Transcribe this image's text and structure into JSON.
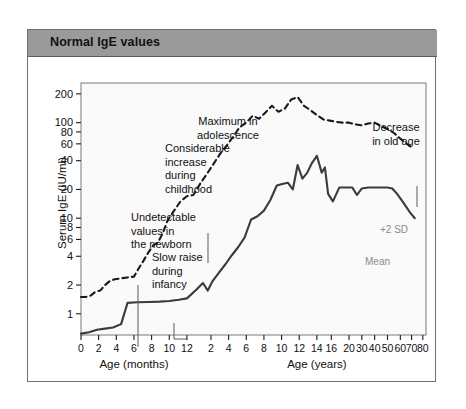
{
  "figure": {
    "title": "Normal IgE values",
    "title_bg": "#9a9a9a",
    "frame_color": "#6e6e6e",
    "plot_bg": "#fafafa"
  },
  "chart_data": {
    "type": "line",
    "title": "Normal IgE values",
    "xlabel_left": "Age (months)",
    "xlabel_right": "Age (years)",
    "ylabel": "Serum IgE (IU/ml)",
    "yscale": "log",
    "ylim": [
      0.6,
      260
    ],
    "yticks": [
      1,
      2,
      4,
      6,
      8,
      10,
      20,
      40,
      60,
      80,
      100,
      200
    ],
    "ytick_labels": [
      "1",
      "2",
      "4",
      "6",
      "8",
      "10",
      "20",
      "40",
      "60",
      "80",
      "100",
      "200"
    ],
    "x_months_ticks": [
      0,
      2,
      4,
      6,
      8,
      10,
      12
    ],
    "x_months_labels": [
      "0",
      "2",
      "4",
      "6",
      "8",
      "10",
      "12"
    ],
    "x_years_ticks": [
      2,
      4,
      6,
      8,
      10,
      12,
      14,
      16,
      20,
      30,
      40,
      50,
      60,
      70,
      80
    ],
    "x_years_labels": [
      "2",
      "4",
      "6",
      "8",
      "10",
      "12",
      "14",
      "16",
      "20",
      "30",
      "40",
      "50",
      "60",
      "70",
      "80"
    ],
    "grid": false,
    "legend": "inline-annotations",
    "series": [
      {
        "name": "+2 SD",
        "style": "dashed",
        "color": "#1a1a1a",
        "label_text": "+2 SD",
        "label_color": "#8b8b8b",
        "points": [
          [
            0.0,
            1.5
          ],
          [
            0.06,
            1.5
          ],
          [
            0.12,
            1.55
          ],
          [
            0.18,
            1.7
          ],
          [
            0.24,
            1.75
          ],
          [
            0.3,
            2.0
          ],
          [
            0.36,
            2.2
          ],
          [
            0.42,
            2.3
          ],
          [
            0.5,
            2.35
          ],
          [
            0.58,
            2.4
          ],
          [
            0.66,
            2.45
          ],
          [
            0.72,
            3.0
          ],
          [
            0.78,
            3.6
          ],
          [
            0.84,
            4.4
          ],
          [
            0.9,
            5.2
          ],
          [
            0.96,
            5.6
          ],
          [
            1.02,
            7.0
          ],
          [
            1.08,
            9.5
          ],
          [
            1.16,
            12.0
          ],
          [
            1.24,
            15.0
          ],
          [
            1.32,
            17.0
          ],
          [
            1.4,
            17.5
          ],
          [
            1.5,
            24.0
          ],
          [
            1.58,
            30.0
          ],
          [
            1.66,
            38.0
          ],
          [
            1.74,
            48.0
          ],
          [
            1.82,
            58.0
          ],
          [
            1.9,
            72.0
          ],
          [
            1.98,
            90.0
          ],
          [
            2.06,
            100.0
          ],
          [
            2.14,
            118.0
          ],
          [
            2.22,
            110.0
          ],
          [
            2.3,
            128.0
          ],
          [
            2.38,
            150.0
          ],
          [
            2.46,
            130.0
          ],
          [
            2.54,
            140.0
          ],
          [
            2.62,
            175.0
          ],
          [
            2.7,
            185.0
          ],
          [
            2.78,
            150.0
          ],
          [
            2.86,
            135.0
          ],
          [
            2.94,
            120.0
          ],
          [
            3.02,
            108.0
          ],
          [
            3.1,
            105.0
          ],
          [
            3.18,
            102.0
          ],
          [
            3.26,
            100.0
          ],
          [
            3.34,
            100.0
          ],
          [
            3.42,
            96.0
          ],
          [
            3.5,
            94.0
          ],
          [
            3.58,
            98.0
          ],
          [
            3.66,
            100.0
          ],
          [
            3.74,
            92.0
          ],
          [
            3.82,
            86.0
          ],
          [
            3.9,
            78.0
          ],
          [
            3.98,
            68.0
          ],
          [
            4.06,
            60.0
          ],
          [
            4.14,
            54.0
          ]
        ]
      },
      {
        "name": "Mean",
        "style": "solid",
        "color": "#3b3b3b",
        "label_text": "Mean",
        "label_color": "#8b8b8b",
        "points": [
          [
            0.0,
            0.62
          ],
          [
            0.1,
            0.64
          ],
          [
            0.2,
            0.68
          ],
          [
            0.3,
            0.7
          ],
          [
            0.4,
            0.72
          ],
          [
            0.5,
            0.78
          ],
          [
            0.58,
            1.3
          ],
          [
            0.7,
            1.32
          ],
          [
            0.84,
            1.33
          ],
          [
            0.98,
            1.34
          ],
          [
            1.1,
            1.36
          ],
          [
            1.22,
            1.4
          ],
          [
            1.32,
            1.45
          ],
          [
            1.44,
            1.8
          ],
          [
            1.52,
            2.1
          ],
          [
            1.58,
            1.75
          ],
          [
            1.64,
            2.2
          ],
          [
            1.72,
            2.7
          ],
          [
            1.8,
            3.3
          ],
          [
            1.88,
            4.1
          ],
          [
            1.96,
            5.0
          ],
          [
            2.04,
            6.3
          ],
          [
            2.12,
            9.7
          ],
          [
            2.2,
            10.5
          ],
          [
            2.28,
            12.0
          ],
          [
            2.36,
            15.5
          ],
          [
            2.44,
            22.0
          ],
          [
            2.52,
            23.0
          ],
          [
            2.58,
            23.5
          ],
          [
            2.64,
            20.0
          ],
          [
            2.7,
            36.0
          ],
          [
            2.76,
            26.0
          ],
          [
            2.82,
            30.0
          ],
          [
            2.88,
            38.0
          ],
          [
            2.94,
            45.0
          ],
          [
            3.0,
            30.0
          ],
          [
            3.04,
            34.0
          ],
          [
            3.08,
            18.0
          ],
          [
            3.14,
            15.0
          ],
          [
            3.22,
            21.0
          ],
          [
            3.3,
            21.0
          ],
          [
            3.38,
            21.0
          ],
          [
            3.44,
            17.5
          ],
          [
            3.5,
            20.5
          ],
          [
            3.58,
            21.0
          ],
          [
            3.66,
            21.0
          ],
          [
            3.74,
            21.0
          ],
          [
            3.82,
            21.0
          ],
          [
            3.88,
            20.5
          ],
          [
            3.94,
            18.0
          ],
          [
            4.02,
            14.5
          ],
          [
            4.1,
            11.5
          ],
          [
            4.16,
            10.0
          ]
        ]
      }
    ],
    "annotations": [
      {
        "id": "undetectable-newborn",
        "text_lines": [
          "Undetectable",
          "values in",
          "the newborn"
        ],
        "x": 103,
        "y": 191,
        "leader": {
          "x1": 110,
          "y1": 228,
          "x2": 110,
          "y2": 290
        }
      },
      {
        "id": "slow-raise-infancy",
        "text_lines": [
          "Slow raise",
          "during",
          "infancy"
        ],
        "x": 124,
        "y": 231,
        "leader": {
          "x1": 146,
          "y1": 266,
          "x2": 146,
          "y2": 282,
          "elbow_x": 160
        }
      },
      {
        "id": "considerable-increase-childhood",
        "text_lines": [
          "Considerable",
          "increase",
          "during",
          "childhood"
        ],
        "x": 137,
        "y": 122,
        "leader": {
          "x1": 180,
          "y1": 176,
          "x2": 180,
          "y2": 206
        }
      },
      {
        "id": "maximum-adolescence",
        "text_lines": [
          "Maximum in",
          "adolescence"
        ],
        "x": 200,
        "y": 95,
        "leader": null
      },
      {
        "id": "decrease-old-age",
        "text_lines": [
          "Decrease",
          "in old age"
        ],
        "x": 368,
        "y": 101,
        "leader": {
          "x1": 389,
          "y1": 129,
          "x2": 389,
          "y2": 150
        }
      }
    ]
  }
}
